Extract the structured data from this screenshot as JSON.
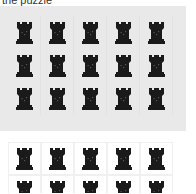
{
  "header": {
    "text": "the puzzle"
  },
  "icon": {
    "name": "chess-rook-icon",
    "color": "#1a1a1a"
  },
  "colors": {
    "panel_bg": "#e9e9e9",
    "page_bg": "#ffffff"
  },
  "puzzle_grid": {
    "rows": 3,
    "cols": 5,
    "tiles": [
      "rook",
      "rook",
      "rook",
      "rook",
      "rook",
      "rook",
      "rook",
      "rook",
      "rook",
      "rook",
      "rook",
      "rook",
      "rook",
      "rook",
      "rook"
    ]
  },
  "answer_grid": {
    "rows": 2,
    "cols": 5,
    "tiles": [
      "rook",
      "rook",
      "rook",
      "rook",
      "rook",
      "rook",
      "rook",
      "rook",
      "rook",
      "rook"
    ]
  }
}
